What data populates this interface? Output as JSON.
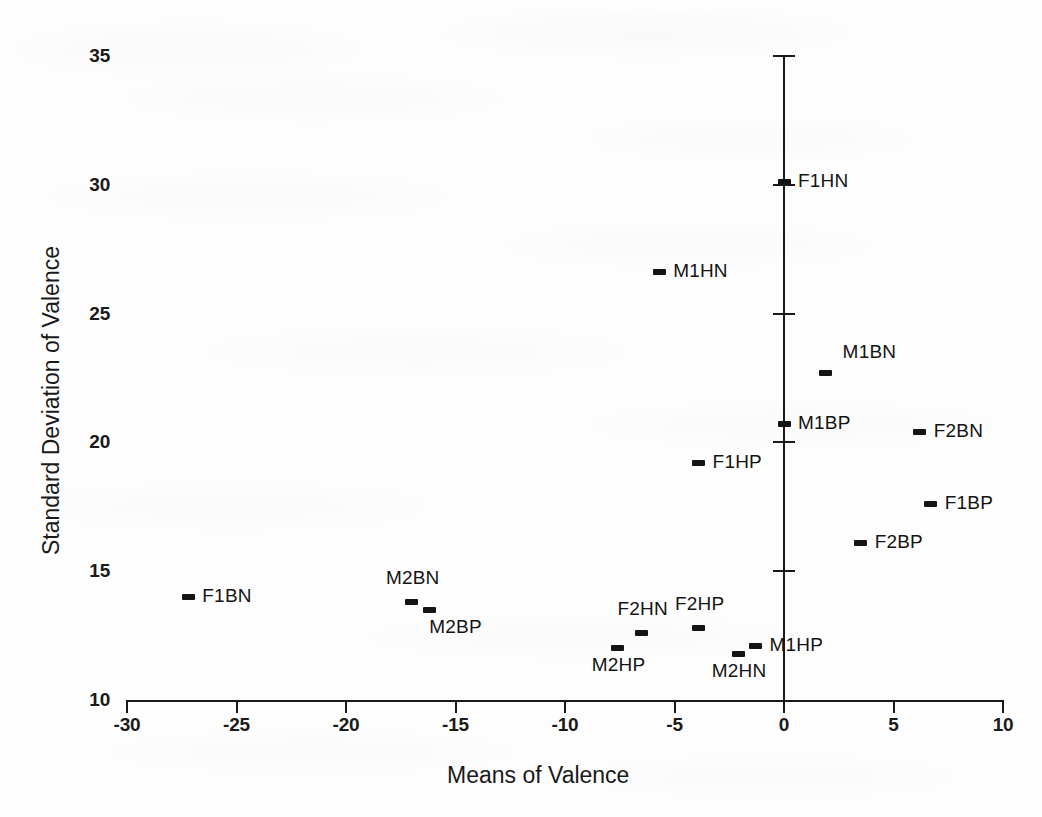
{
  "figure": {
    "background_color": "#fdfdfd",
    "ink_color": "#141414"
  },
  "chart_data": {
    "type": "scatter",
    "title": "",
    "xlabel": "Means of Valence",
    "ylabel": "Standard Deviation of Valence",
    "xlim": [
      -30,
      10
    ],
    "ylim": [
      10,
      35
    ],
    "xticks": [
      -30,
      -25,
      -20,
      -15,
      -10,
      -5,
      0,
      5,
      10
    ],
    "xticklabels": [
      "-30",
      "-25",
      "-20",
      "-15",
      "-10",
      "-5",
      "0",
      "5",
      "10"
    ],
    "yticks": [
      10,
      15,
      20,
      25,
      30,
      35
    ],
    "yticklabels": [
      "10",
      "15",
      "20",
      "25",
      "30",
      "35"
    ],
    "grid": false,
    "legend": "none",
    "y_axis_position": "x=0",
    "points": [
      {
        "label": "F1HN",
        "x": 0.0,
        "y": 30.1,
        "label_side": "right"
      },
      {
        "label": "M1HN",
        "x": -5.7,
        "y": 26.6,
        "label_side": "right"
      },
      {
        "label": "M1BN",
        "x": 1.9,
        "y": 22.7,
        "label_side": "right-up"
      },
      {
        "label": "M1BP",
        "x": 0.0,
        "y": 20.7,
        "label_side": "right"
      },
      {
        "label": "F2BN",
        "x": 6.2,
        "y": 20.4,
        "label_side": "right"
      },
      {
        "label": "F1HP",
        "x": -3.9,
        "y": 19.2,
        "label_side": "right"
      },
      {
        "label": "F1BP",
        "x": 6.7,
        "y": 17.6,
        "label_side": "right"
      },
      {
        "label": "F2BP",
        "x": 3.5,
        "y": 16.1,
        "label_side": "right"
      },
      {
        "label": "F1BN",
        "x": -27.2,
        "y": 14.0,
        "label_side": "right"
      },
      {
        "label": "M2BN",
        "x": -17.0,
        "y": 13.8,
        "label_side": "up"
      },
      {
        "label": "M2BP",
        "x": -16.2,
        "y": 13.5,
        "label_side": "down-right"
      },
      {
        "label": "F2HP",
        "x": -3.9,
        "y": 12.8,
        "label_side": "up"
      },
      {
        "label": "F2HN",
        "x": -6.5,
        "y": 12.6,
        "label_side": "up"
      },
      {
        "label": "M1HP",
        "x": -1.3,
        "y": 12.1,
        "label_side": "right"
      },
      {
        "label": "M2HP",
        "x": -7.6,
        "y": 12.0,
        "label_side": "down"
      },
      {
        "label": "M2HN",
        "x": -2.1,
        "y": 11.8,
        "label_side": "down"
      }
    ]
  }
}
